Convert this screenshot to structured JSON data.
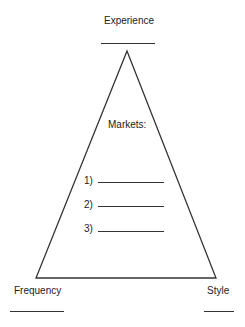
{
  "diagram": {
    "top_label": "Experience",
    "center_heading": "Markets:",
    "market_items": [
      {
        "number": "1)",
        "value": ""
      },
      {
        "number": "2)",
        "value": ""
      },
      {
        "number": "3)",
        "value": ""
      }
    ],
    "bottom_left_label": "Frequency",
    "bottom_right_label": "Style",
    "shape": "triangle",
    "line_color": "#333333"
  }
}
